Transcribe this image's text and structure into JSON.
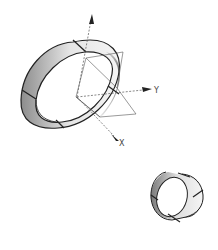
{
  "diagram": {
    "type": "3d-isometric-sketch",
    "axes": [
      {
        "name": "Z",
        "label": "",
        "direction": "up"
      },
      {
        "name": "Y",
        "label": "Y",
        "direction": "right"
      },
      {
        "name": "X",
        "label": "X",
        "direction": "down-right"
      }
    ],
    "objects": [
      {
        "name": "large-ring",
        "description": "thick cylindrical ring with seam lines, centered on axis origin"
      },
      {
        "name": "reference-plane",
        "description": "rectangular plane through origin"
      },
      {
        "name": "small-ring",
        "description": "smaller cylindrical ring, bottom right"
      }
    ],
    "colors": {
      "line": "#222222",
      "shade": "#9a9a9a",
      "axis": "#555555"
    }
  }
}
